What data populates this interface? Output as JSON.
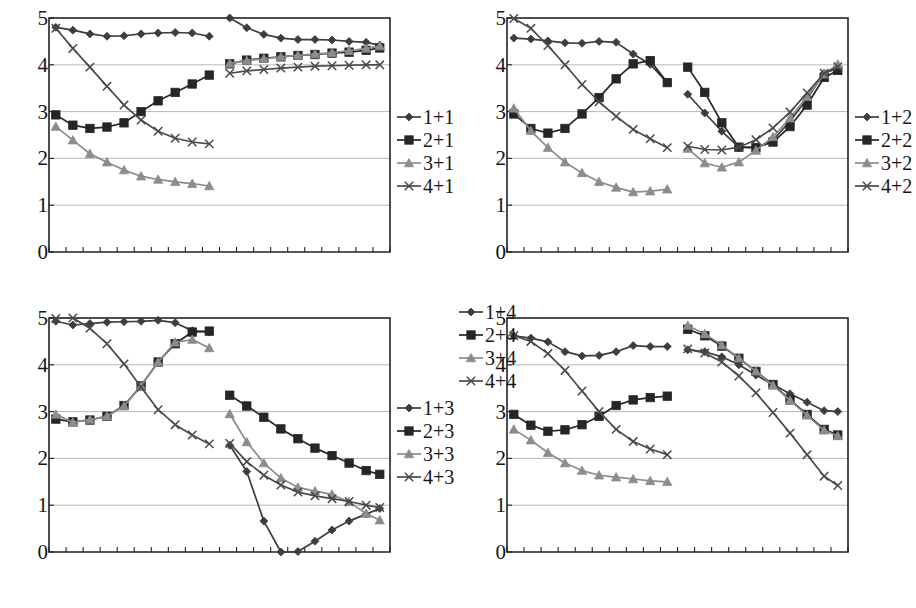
{
  "figure": {
    "title": "",
    "panel_count": 4
  },
  "axis": {
    "ylim": [
      0,
      5
    ],
    "yticks": [
      "0",
      "1",
      "2",
      "3",
      "4",
      "5"
    ],
    "xticks_count": 20,
    "xlabel": "",
    "ylabel": "",
    "grid": "horizontal"
  },
  "palette": {
    "series1": "#3d3d3d",
    "series2": "#262626",
    "series3": "#8c8c8c",
    "series4": "#4a4a4a",
    "axis": "#222222",
    "grid": "#9a9a9a",
    "background": "#ffffff"
  },
  "markers": {
    "series1": "diamond-marker",
    "series2": "square-marker",
    "series3": "triangle-marker",
    "series4": "cross-marker"
  },
  "chart_data": [
    {
      "type": "line",
      "panel": "top-left",
      "title": "",
      "xlabel": "",
      "ylabel": "",
      "ylim": [
        0,
        5
      ],
      "xlim": [
        0,
        20
      ],
      "grid": true,
      "legend_position": "right",
      "x_left": [
        0.4,
        1.4,
        2.4,
        3.4,
        4.4,
        5.4,
        6.4,
        7.4,
        8.4,
        9.4
      ],
      "x_right": [
        10.6,
        11.6,
        12.6,
        13.6,
        14.6,
        15.6,
        16.6,
        17.6,
        18.6,
        19.4
      ],
      "series": [
        {
          "name": "1+1",
          "marker": "diamond-marker",
          "color": "#3d3d3d",
          "left": [
            4.8,
            4.74,
            4.66,
            4.61,
            4.62,
            4.66,
            4.68,
            4.69,
            4.68,
            4.61
          ],
          "right": [
            5.0,
            4.79,
            4.65,
            4.57,
            4.54,
            4.54,
            4.53,
            4.5,
            4.48,
            4.42
          ]
        },
        {
          "name": "2+1",
          "marker": "square-marker",
          "color": "#262626",
          "left": [
            2.93,
            2.71,
            2.64,
            2.67,
            2.76,
            3.0,
            3.23,
            3.41,
            3.59,
            3.78
          ],
          "right": [
            4.02,
            4.1,
            4.14,
            4.17,
            4.2,
            4.22,
            4.25,
            4.27,
            4.31,
            4.36
          ]
        },
        {
          "name": "3+1",
          "marker": "triangle-marker",
          "color": "#8c8c8c",
          "left": [
            2.68,
            2.39,
            2.1,
            1.92,
            1.75,
            1.62,
            1.55,
            1.5,
            1.46,
            1.41
          ],
          "right": [
            4.03,
            4.09,
            4.13,
            4.17,
            4.2,
            4.23,
            4.26,
            4.3,
            4.35,
            4.4
          ]
        },
        {
          "name": "4+1",
          "marker": "cross-marker",
          "color": "#4a4a4a",
          "left": [
            4.78,
            4.35,
            3.95,
            3.54,
            3.14,
            2.82,
            2.58,
            2.43,
            2.35,
            2.31
          ],
          "right": [
            3.82,
            3.87,
            3.9,
            3.93,
            3.95,
            3.97,
            3.98,
            3.99,
            4.0,
            4.0
          ]
        }
      ],
      "legend": [
        "1+1",
        "2+1",
        "3+1",
        "4+1"
      ]
    },
    {
      "type": "line",
      "panel": "top-right",
      "title": "",
      "xlabel": "",
      "ylabel": "",
      "ylim": [
        0,
        5
      ],
      "xlim": [
        0,
        20
      ],
      "grid": true,
      "legend_position": "right",
      "x_left": [
        0.4,
        1.4,
        2.4,
        3.4,
        4.4,
        5.4,
        6.4,
        7.4,
        8.4,
        9.4
      ],
      "x_right": [
        10.6,
        11.6,
        12.6,
        13.6,
        14.6,
        15.6,
        16.6,
        17.6,
        18.6,
        19.4
      ],
      "series": [
        {
          "name": "1+2",
          "marker": "diamond-marker",
          "color": "#3d3d3d",
          "left": [
            4.57,
            4.55,
            4.51,
            4.47,
            4.46,
            4.5,
            4.48,
            4.23,
            4.01,
            3.62
          ],
          "right": [
            3.37,
            2.97,
            2.58,
            2.24,
            2.23,
            2.39,
            2.79,
            3.28,
            3.82,
            3.92
          ]
        },
        {
          "name": "2+2",
          "marker": "square-marker",
          "color": "#262626",
          "left": [
            2.95,
            2.64,
            2.54,
            2.64,
            2.95,
            3.3,
            3.7,
            4.02,
            4.09,
            3.62
          ],
          "right": [
            3.95,
            3.41,
            2.76,
            2.24,
            2.23,
            2.35,
            2.68,
            3.14,
            3.73,
            3.88
          ]
        },
        {
          "name": "3+2",
          "marker": "triangle-marker",
          "color": "#8c8c8c",
          "left": [
            3.07,
            2.59,
            2.23,
            1.92,
            1.69,
            1.5,
            1.38,
            1.28,
            1.3,
            1.34
          ],
          "right": [
            2.21,
            1.9,
            1.81,
            1.92,
            2.17,
            2.46,
            2.86,
            3.32,
            3.8,
            4.01
          ]
        },
        {
          "name": "4+2",
          "marker": "cross-marker",
          "color": "#4a4a4a",
          "left": [
            4.99,
            4.78,
            4.41,
            4.0,
            3.58,
            3.21,
            2.9,
            2.62,
            2.42,
            2.23
          ],
          "right": [
            2.26,
            2.19,
            2.18,
            2.24,
            2.4,
            2.65,
            2.99,
            3.4,
            3.82,
            3.96
          ]
        }
      ],
      "legend": [
        "1+2",
        "2+2",
        "3+2",
        "4+2"
      ]
    },
    {
      "type": "line",
      "panel": "bottom-left",
      "title": "",
      "xlabel": "",
      "ylabel": "",
      "ylim": [
        0,
        5
      ],
      "xlim": [
        0,
        20
      ],
      "grid": true,
      "legend_position": "right",
      "x_left": [
        0.4,
        1.4,
        2.4,
        3.4,
        4.4,
        5.4,
        6.4,
        7.4,
        8.4,
        9.4
      ],
      "x_right": [
        10.6,
        11.6,
        12.6,
        13.6,
        14.6,
        15.6,
        16.6,
        17.6,
        18.6,
        19.4
      ],
      "series": [
        {
          "name": "1+3",
          "marker": "diamond-marker",
          "color": "#3d3d3d",
          "left": [
            4.93,
            4.85,
            4.88,
            4.91,
            4.92,
            4.93,
            4.95,
            4.9,
            4.73,
            4.7
          ],
          "right": [
            2.28,
            1.72,
            0.66,
            0.0,
            0.01,
            0.23,
            0.47,
            0.66,
            0.81,
            0.93
          ]
        },
        {
          "name": "2+3",
          "marker": "square-marker",
          "color": "#262626",
          "left": [
            2.84,
            2.78,
            2.82,
            2.9,
            3.13,
            3.55,
            4.06,
            4.45,
            4.7,
            4.72
          ],
          "right": [
            3.35,
            3.12,
            2.88,
            2.63,
            2.42,
            2.22,
            2.06,
            1.9,
            1.74,
            1.66
          ]
        },
        {
          "name": "3+3",
          "marker": "triangle-marker",
          "color": "#8c8c8c",
          "left": [
            2.94,
            2.77,
            2.83,
            2.9,
            3.12,
            3.55,
            4.06,
            4.48,
            4.54,
            4.36
          ],
          "right": [
            2.95,
            2.35,
            1.9,
            1.58,
            1.38,
            1.3,
            1.23,
            1.07,
            0.82,
            0.68
          ]
        },
        {
          "name": "4+3",
          "marker": "cross-marker",
          "color": "#4a4a4a",
          "left": [
            4.99,
            5.0,
            4.78,
            4.45,
            4.02,
            3.52,
            3.04,
            2.72,
            2.5,
            2.31
          ],
          "right": [
            2.32,
            1.93,
            1.64,
            1.43,
            1.28,
            1.2,
            1.14,
            1.08,
            1.0,
            0.95
          ]
        }
      ],
      "legend": [
        "1+3",
        "2+3",
        "3+3",
        "4+3"
      ]
    },
    {
      "type": "line",
      "panel": "bottom-right",
      "title": "",
      "xlabel": "",
      "ylabel": "",
      "ylim": [
        0,
        5
      ],
      "xlim": [
        0,
        20
      ],
      "grid": true,
      "legend_position": "right",
      "x_left": [
        0.4,
        1.4,
        2.4,
        3.4,
        4.4,
        5.4,
        6.4,
        7.4,
        8.4,
        9.4
      ],
      "x_right": [
        10.6,
        11.6,
        12.6,
        13.6,
        14.6,
        15.6,
        16.6,
        17.6,
        18.6,
        19.4
      ],
      "series": [
        {
          "name": "1+4",
          "marker": "diamond-marker",
          "color": "#3d3d3d",
          "left": [
            4.62,
            4.57,
            4.49,
            4.28,
            4.19,
            4.2,
            4.28,
            4.41,
            4.39,
            4.39
          ],
          "right": [
            4.32,
            4.28,
            4.17,
            4.0,
            3.78,
            3.58,
            3.38,
            3.2,
            3.02,
            3.0
          ]
        },
        {
          "name": "2+4",
          "marker": "square-marker",
          "color": "#262626",
          "left": [
            2.94,
            2.71,
            2.58,
            2.61,
            2.72,
            2.9,
            3.13,
            3.25,
            3.3,
            3.33
          ],
          "right": [
            4.76,
            4.62,
            4.4,
            4.14,
            3.86,
            3.58,
            3.25,
            2.94,
            2.62,
            2.5
          ]
        },
        {
          "name": "3+4",
          "marker": "triangle-marker",
          "color": "#8c8c8c",
          "left": [
            2.62,
            2.39,
            2.12,
            1.9,
            1.74,
            1.64,
            1.6,
            1.56,
            1.52,
            1.5
          ],
          "right": [
            4.84,
            4.66,
            4.42,
            4.14,
            3.86,
            3.56,
            3.24,
            2.92,
            2.6,
            2.48
          ]
        },
        {
          "name": "4+4",
          "marker": "cross-marker",
          "color": "#4a4a4a",
          "left": [
            4.62,
            4.5,
            4.24,
            3.88,
            3.44,
            3.0,
            2.62,
            2.36,
            2.2,
            2.08
          ],
          "right": [
            4.34,
            4.25,
            4.06,
            3.76,
            3.4,
            2.98,
            2.54,
            2.08,
            1.62,
            1.42
          ]
        }
      ],
      "legend": [
        "1+4",
        "2+4",
        "3+4",
        "4+4"
      ]
    }
  ]
}
